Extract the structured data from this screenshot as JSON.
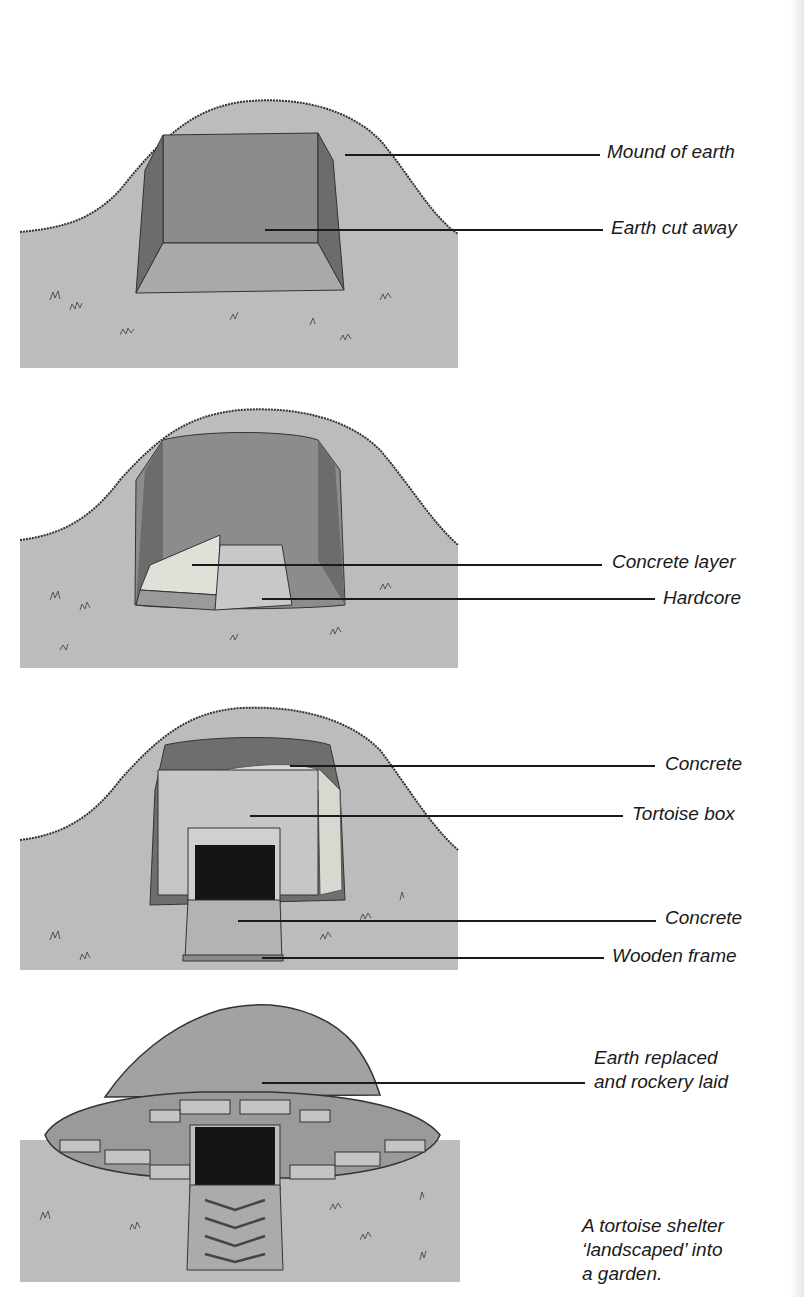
{
  "figure": {
    "colors": {
      "ground": "#b9b9b9",
      "cut_back": "#8a8a8a",
      "cut_side": "#6e6e6e",
      "cut_floor": "#a8a8a8",
      "ink": "#1a1a1a"
    }
  },
  "panels": [
    {
      "step": 1,
      "labels": [
        {
          "text": "Mound of earth"
        },
        {
          "text": "Earth cut away"
        }
      ]
    },
    {
      "step": 2,
      "labels": [
        {
          "text": "Concrete layer"
        },
        {
          "text": "Hardcore"
        }
      ]
    },
    {
      "step": 3,
      "labels": [
        {
          "text": "Concrete"
        },
        {
          "text": "Tortoise box"
        },
        {
          "text": "Concrete"
        },
        {
          "text": "Wooden frame"
        }
      ]
    },
    {
      "step": 4,
      "labels": [
        {
          "line1": "Earth replaced",
          "line2": "and rockery laid"
        }
      ],
      "caption": {
        "line1": "A tortoise shelter",
        "line2": "‘landscaped’ into",
        "line3": "a garden."
      }
    }
  ]
}
